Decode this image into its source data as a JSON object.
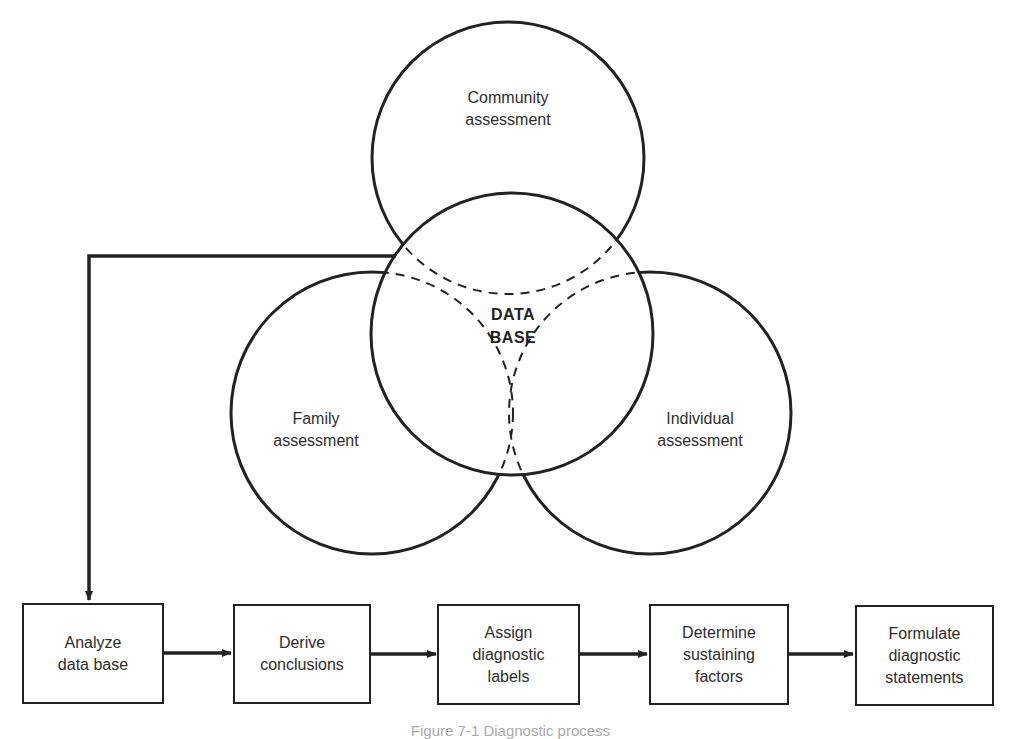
{
  "figure": {
    "caption": "Figure 7-1 Diagnostic process"
  },
  "venn": {
    "center": {
      "lines": [
        "DATA",
        "BASE"
      ]
    },
    "circles": [
      {
        "id": "community",
        "lines": [
          "Community",
          "assessment"
        ],
        "cx": 508,
        "cy": 158,
        "r": 136
      },
      {
        "id": "family",
        "lines": [
          "Family",
          "assessment"
        ],
        "cx": 372,
        "cy": 413,
        "r": 141
      },
      {
        "id": "individual",
        "lines": [
          "Individual",
          "assessment"
        ],
        "cx": 650,
        "cy": 413,
        "r": 141
      },
      {
        "id": "data-base",
        "cx": 512,
        "cy": 334,
        "r": 141
      }
    ]
  },
  "flow": {
    "steps": [
      {
        "lines": [
          "Analyze",
          "data base"
        ]
      },
      {
        "lines": [
          "Derive",
          "conclusions"
        ]
      },
      {
        "lines": [
          "Assign",
          "diagnostic",
          "labels"
        ]
      },
      {
        "lines": [
          "Determine",
          "sustaining",
          "factors"
        ]
      },
      {
        "lines": [
          "Formulate",
          "diagnostic",
          "statements"
        ]
      }
    ]
  },
  "colors": {
    "stroke": "#222222",
    "text": "#2d2d2d",
    "background": "#ffffff"
  }
}
